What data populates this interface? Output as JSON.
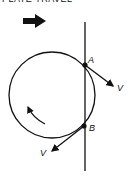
{
  "title": "PLATE TRAVEL",
  "labels": {
    "point_a": "A",
    "point_b": "B",
    "velocity_a": "V",
    "velocity_b": "V"
  },
  "icons": {
    "travel_direction": "right-arrow-icon",
    "rotation_direction": "counterclockwise-arrow-icon"
  },
  "colors": {
    "ink": "#111111",
    "background": "#ffffff"
  }
}
